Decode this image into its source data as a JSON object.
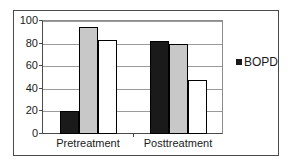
{
  "chart_data": {
    "type": "bar",
    "title": "",
    "xlabel": "",
    "ylabel": "",
    "categories": [
      "Pretreatment",
      "Posttreatment"
    ],
    "series": [
      {
        "name": "series-1",
        "color": "#1a1a1a",
        "values": [
          20,
          82
        ]
      },
      {
        "name": "series-2",
        "color": "#c8c8c8",
        "values": [
          95,
          80
        ]
      },
      {
        "name": "series-3",
        "color": "#ffffff",
        "values": [
          83,
          48
        ]
      }
    ],
    "ylim": [
      0,
      100
    ],
    "ytick_values": [
      0,
      20,
      40,
      60,
      80,
      100
    ],
    "ytick_labels": [
      "0",
      "20",
      "40",
      "60",
      "80",
      "100"
    ],
    "grid": true,
    "legend_position": "right",
    "legend": [
      {
        "label": "BOPD",
        "color": "#1a1a1a"
      }
    ]
  },
  "legend": {
    "marker_name": "legend-square-marker",
    "label": "BOPD"
  },
  "colors": {
    "bar_dark": "#1a1a1a",
    "bar_gray": "#c8c8c8",
    "bar_white": "#ffffff",
    "axis": "#4a4a4a",
    "gridline": "#9a9a9a",
    "frame": "#4a4a4a",
    "background": "#ffffff"
  }
}
